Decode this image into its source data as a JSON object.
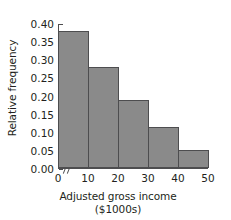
{
  "chart_data": {
    "type": "bar",
    "title": "",
    "xlabel": "Adjusted gross income",
    "xlabel_sub": "($1000s)",
    "ylabel": "Relative frequency",
    "categories": [
      "0-10",
      "10-20",
      "20-30",
      "30-40",
      "40-50"
    ],
    "bin_edges": [
      0,
      10,
      20,
      30,
      40,
      50
    ],
    "values": [
      0.38,
      0.28,
      0.19,
      0.115,
      0.05
    ],
    "xlim": [
      0,
      50
    ],
    "ylim": [
      0.0,
      0.4
    ],
    "x_ticks": [
      "0",
      "10",
      "20",
      "30",
      "40",
      "50"
    ],
    "x_tick_values": [
      0,
      10,
      20,
      30,
      40,
      50
    ],
    "y_ticks": [
      "0.00",
      "0.05",
      "0.10",
      "0.15",
      "0.20",
      "0.25",
      "0.30",
      "0.35",
      "0.40"
    ],
    "y_tick_values": [
      0.0,
      0.05,
      0.1,
      0.15,
      0.2,
      0.25,
      0.3,
      0.35,
      0.4
    ],
    "grid": false,
    "legend": null,
    "bar_fill_color": "#8a8a8a",
    "bar_edge_color": "#4d4d4f",
    "axis_color": "#4d4d4f",
    "axis_break": "//",
    "background_color": "#ffffff"
  }
}
